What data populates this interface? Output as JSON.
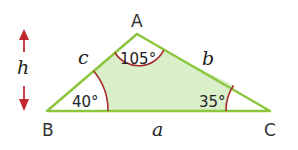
{
  "diagram": {
    "type": "triangle",
    "colors": {
      "edge": "#8cc63f",
      "fill": "#d9efc9",
      "arc": "#a52a2a",
      "arrow": "#c1272d"
    },
    "vertices": {
      "A": {
        "label": "A",
        "x": 137,
        "y": 34
      },
      "B": {
        "label": "B",
        "x": 47,
        "y": 111
      },
      "C": {
        "label": "C",
        "x": 270,
        "y": 111
      }
    },
    "sides": {
      "a": {
        "label": "a"
      },
      "b": {
        "label": "b"
      },
      "c": {
        "label": "c"
      }
    },
    "angles": {
      "A": {
        "label": "105°",
        "value": 105
      },
      "B": {
        "label": "40°",
        "value": 40
      },
      "C": {
        "label": "35°",
        "value": 35
      }
    },
    "height_marker": {
      "label": "h"
    }
  }
}
